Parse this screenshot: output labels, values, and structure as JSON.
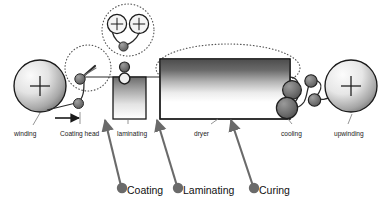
{
  "diagram": {
    "background_color": "#ffffff",
    "colors": {
      "outline": "#1a1a1a",
      "roller_fill_dark": "#6e6e6e",
      "roller_fill_mid": "#8a8a8a",
      "roll_gradient_light": "#f2f2f2",
      "roll_gradient_dark": "#7a7a7a",
      "dryer_band_dark": "#5f5f5f",
      "dotted_outline": "#555555",
      "arrow_gray": "#6a6a6a",
      "text": "#1a1a1a",
      "web_line": "#3a3a3a"
    },
    "part_labels": [
      {
        "id": "winding",
        "label": "winding"
      },
      {
        "id": "coating-head",
        "label": "Coating head"
      },
      {
        "id": "laminating",
        "label": "laminating"
      },
      {
        "id": "dryer",
        "label": "dryer"
      },
      {
        "id": "cooling",
        "label": "cooling"
      },
      {
        "id": "upwinding",
        "label": "upwinding"
      }
    ],
    "process_callouts": [
      {
        "id": "coating",
        "label": "Coating"
      },
      {
        "id": "laminating",
        "label": "Laminating"
      },
      {
        "id": "curing",
        "label": "Curing"
      }
    ],
    "detail_bubble": {
      "id": "coating-head-detail",
      "roll_count": 2,
      "description": "magnified view of coating head rolls"
    },
    "web_direction": {
      "id": "web-direction-arrow",
      "description": "arrow indicating web travel direction, left to right"
    },
    "highlight_regions": [
      {
        "id": "coating-head-highlight",
        "shape": "dotted-circle"
      },
      {
        "id": "detail-bubble-highlight",
        "shape": "dotted-circle"
      },
      {
        "id": "dryer-highlight",
        "shape": "dotted-ellipse"
      }
    ]
  }
}
